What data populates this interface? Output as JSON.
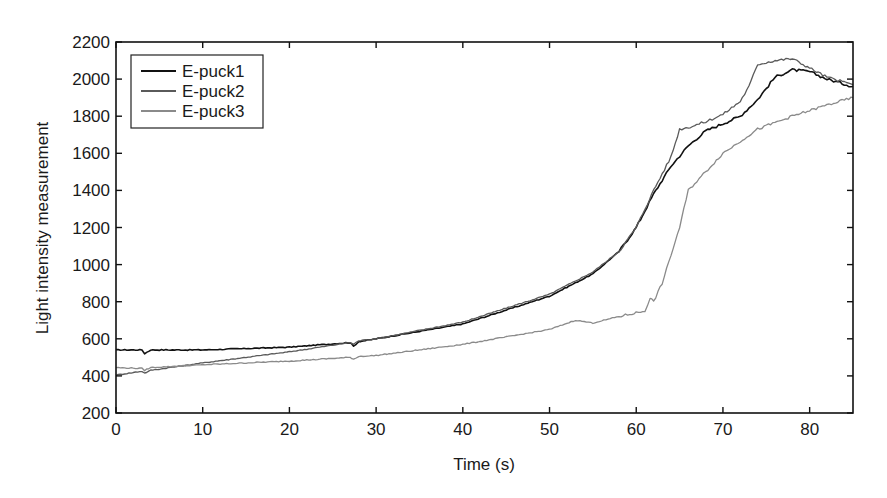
{
  "chart_data": {
    "type": "line",
    "title": "",
    "xlabel": "Time (s)",
    "ylabel": "Light intensity measurement",
    "xlim": [
      0,
      85
    ],
    "ylim": [
      200,
      2200
    ],
    "xticks": [
      0,
      10,
      20,
      30,
      40,
      50,
      60,
      70,
      80
    ],
    "yticks": [
      200,
      400,
      600,
      800,
      1000,
      1200,
      1400,
      1600,
      1800,
      2000,
      2200
    ],
    "grid": false,
    "legend_position": "upper left",
    "series": [
      {
        "name": "E-puck1",
        "color": "#111111",
        "x": [
          0,
          3,
          3.3,
          4,
          10,
          20,
          27,
          27.4,
          28,
          30,
          40,
          50,
          55,
          58,
          60,
          62,
          64,
          66,
          68,
          70,
          72,
          74,
          76,
          78,
          80,
          82,
          85
        ],
        "y": [
          540,
          540,
          520,
          540,
          540,
          555,
          580,
          560,
          585,
          600,
          680,
          830,
          950,
          1070,
          1200,
          1380,
          1530,
          1640,
          1720,
          1760,
          1800,
          1890,
          2010,
          2050,
          2040,
          2000,
          1960
        ]
      },
      {
        "name": "E-puck2",
        "color": "#5a5a5a",
        "x": [
          0,
          3,
          3.3,
          4,
          10,
          20,
          27,
          27.4,
          28,
          30,
          40,
          50,
          55,
          58,
          60,
          62,
          64,
          65,
          66,
          68,
          70,
          72,
          73,
          74,
          76,
          78,
          80,
          82,
          85
        ],
        "y": [
          405,
          425,
          415,
          430,
          470,
          530,
          580,
          570,
          590,
          600,
          690,
          840,
          960,
          1070,
          1200,
          1400,
          1580,
          1730,
          1740,
          1770,
          1810,
          1880,
          1960,
          2080,
          2100,
          2110,
          2060,
          2010,
          1970
        ]
      },
      {
        "name": "E-puck3",
        "color": "#8a8a8a",
        "x": [
          0,
          3,
          3.3,
          4,
          10,
          20,
          27,
          27.4,
          28,
          30,
          40,
          50,
          53,
          55,
          58,
          61,
          61.6,
          62,
          63,
          64,
          65,
          66,
          68,
          70,
          74,
          78,
          82,
          85
        ],
        "y": [
          445,
          440,
          430,
          445,
          460,
          480,
          500,
          490,
          505,
          510,
          570,
          650,
          700,
          685,
          720,
          750,
          820,
          800,
          900,
          1050,
          1200,
          1400,
          1500,
          1600,
          1730,
          1800,
          1860,
          1900
        ]
      }
    ]
  }
}
